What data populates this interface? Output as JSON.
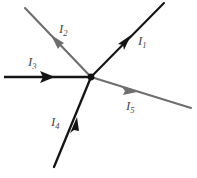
{
  "figure": {
    "type": "circuit-junction-diagram",
    "background_color": "#ffffff",
    "junction": {
      "label": "junction-node",
      "x": 91,
      "y": 77,
      "radius": 3.2,
      "color": "#111111"
    },
    "branches": [
      {
        "id": "I1",
        "label": "I",
        "subscript": "1",
        "color": "#141414",
        "stroke_width": 2.1,
        "direction": "up-right",
        "flow": "out-of-junction",
        "line": {
          "x1": 91,
          "y1": 77,
          "x2": 163,
          "y2": 3
        },
        "arrow": {
          "x": 128,
          "y": 39,
          "angle_deg": -45.8
        },
        "label_pos": {
          "x": 138,
          "y": 34
        }
      },
      {
        "id": "I2",
        "label": "I",
        "subscript": "2",
        "color": "#6e6e6e",
        "stroke_width": 2.1,
        "direction": "up-left",
        "flow": "out-of-junction",
        "line": {
          "x1": 91,
          "y1": 77,
          "x2": 25,
          "y2": 8
        },
        "arrow": {
          "x": 57,
          "y": 41,
          "angle_deg": 226.2
        },
        "label_pos": {
          "x": 59,
          "y": 22
        }
      },
      {
        "id": "I3",
        "label": "I",
        "subscript": "3",
        "color": "#141414",
        "stroke_width": 2.3,
        "direction": "left-horizontal",
        "flow": "into-junction",
        "line": {
          "x1": 5,
          "y1": 77,
          "x2": 91,
          "y2": 77
        },
        "arrow": {
          "x": 53,
          "y": 77,
          "angle_deg": 0
        },
        "label_pos": {
          "x": 28,
          "y": 55
        }
      },
      {
        "id": "I4",
        "label": "I",
        "subscript": "4",
        "color": "#141414",
        "stroke_width": 2.3,
        "direction": "down-left",
        "flow": "into-junction",
        "line": {
          "x1": 55,
          "y1": 166,
          "x2": 91,
          "y2": 77
        },
        "arrow": {
          "x": 74,
          "y": 124,
          "angle_deg": -68.0
        },
        "label_pos": {
          "x": 51,
          "y": 115
        }
      },
      {
        "id": "I5",
        "label": "I",
        "subscript": "5",
        "color": "#6e6e6e",
        "stroke_width": 2.1,
        "direction": "down-right",
        "flow": "out-of-junction",
        "line": {
          "x1": 91,
          "y1": 77,
          "x2": 191,
          "y2": 108
        },
        "arrow": {
          "x": 135,
          "y": 91,
          "angle_deg": 17.2
        },
        "label_pos": {
          "x": 126,
          "y": 99
        }
      }
    ]
  }
}
